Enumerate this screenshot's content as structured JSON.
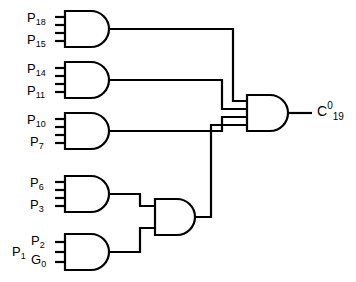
{
  "diagram": {
    "output_label": {
      "base": "C",
      "sup": "0",
      "sub": "19"
    },
    "gates": [
      {
        "id": "gate-p18-p15",
        "name": "and-gate-1",
        "type": "AND",
        "input_count": 4,
        "inputs": [
          {
            "base": "P",
            "sub": "18"
          },
          {
            "base": "P",
            "sub": "15"
          }
        ]
      },
      {
        "id": "gate-p14-p11",
        "name": "and-gate-2",
        "type": "AND",
        "input_count": 4,
        "inputs": [
          {
            "base": "P",
            "sub": "14"
          },
          {
            "base": "P",
            "sub": "11"
          }
        ]
      },
      {
        "id": "gate-p10-p7",
        "name": "and-gate-3",
        "type": "AND",
        "input_count": 4,
        "inputs": [
          {
            "base": "P",
            "sub": "10"
          },
          {
            "base": "P",
            "sub": "7"
          }
        ]
      },
      {
        "id": "gate-p6-p3",
        "name": "and-gate-4",
        "type": "AND",
        "input_count": 4,
        "inputs": [
          {
            "base": "P",
            "sub": "6"
          },
          {
            "base": "P",
            "sub": "3"
          }
        ]
      },
      {
        "id": "gate-p1-p2-g0",
        "name": "and-gate-5",
        "type": "AND",
        "input_count": 3,
        "inputs": [
          {
            "base": "P",
            "sub": "1"
          },
          {
            "base": "P",
            "sub": "2"
          },
          {
            "base": "G",
            "sub": "0"
          }
        ]
      },
      {
        "id": "gate-merge",
        "name": "and-gate-6",
        "type": "AND",
        "input_count": 2,
        "inputs": []
      },
      {
        "id": "gate-output",
        "name": "and-gate-output",
        "type": "AND",
        "input_count": 4,
        "inputs": []
      }
    ],
    "colors": {
      "stroke": "#000000",
      "background": "#ffffff"
    }
  }
}
